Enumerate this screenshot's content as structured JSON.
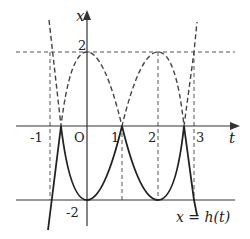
{
  "figure": {
    "axes": {
      "horizontal_label": "t",
      "vertical_label": "x",
      "origin_label": "O"
    },
    "tick_labels": {
      "t": [
        "-1",
        "1",
        "2",
        "3"
      ],
      "x": [
        "2",
        "-2"
      ]
    },
    "curve_label": "x = h(t)",
    "colors": {
      "axis": "#333333",
      "solid_curve": "#222222",
      "dashed": "#444444",
      "background": "#ffffff"
    }
  }
}
